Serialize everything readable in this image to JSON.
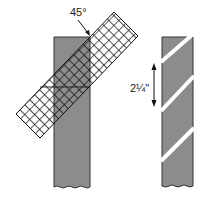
{
  "diagram": {
    "angle_label": "45°",
    "width_label": "2¼\"",
    "colors": {
      "fabric": "#8c8c8c",
      "outline": "#333333",
      "grid": "#111111",
      "background": "#ffffff"
    },
    "left_figure": {
      "description": "Fabric strip with grid ruler laid at 45 degrees"
    },
    "right_figure": {
      "description": "Fabric strip marked with diagonal bias cut lines",
      "stripe_count": 3
    }
  }
}
